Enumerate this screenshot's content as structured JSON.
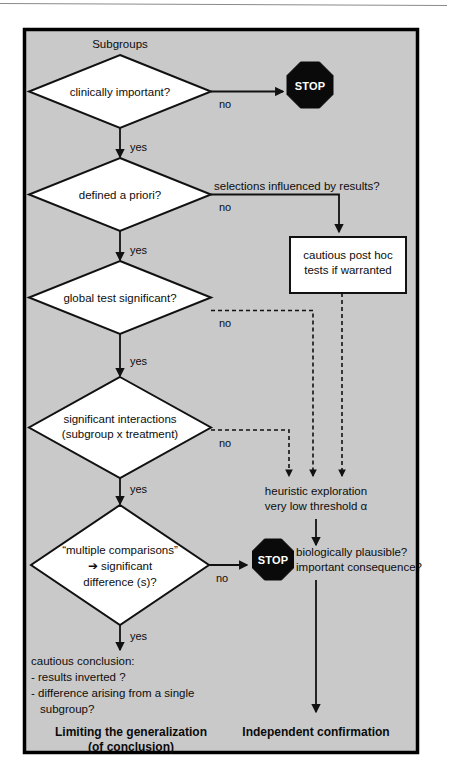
{
  "figure": {
    "title_text": "Subgroups",
    "panel_fill": "#c9c9c9",
    "border_color": "#000000"
  },
  "nodes": {
    "start_label": "Subgroups",
    "decisions": [
      {
        "id": "clinically-important",
        "lines": [
          "clinically important?"
        ]
      },
      {
        "id": "defined-a-priori",
        "lines": [
          "defined a priori?"
        ]
      },
      {
        "id": "global-test-significant",
        "lines": [
          "global test significant?"
        ]
      },
      {
        "id": "significant-interactions",
        "lines": [
          "significant interactions",
          "(subgroup x treatment)"
        ]
      },
      {
        "id": "multiple-comparisons",
        "lines": [
          "“multiple comparisons”",
          "➔ significant",
          "difference (s)?"
        ]
      }
    ],
    "process_box": {
      "id": "cautious-post-hoc",
      "lines": [
        "cautious post hoc",
        "tests if warranted"
      ]
    },
    "stops": [
      {
        "id": "stop-top",
        "label": "STOP"
      },
      {
        "id": "stop-bottom",
        "label": "STOP"
      }
    ]
  },
  "edge_labels": {
    "no_1": "no",
    "yes_1": "yes",
    "no_2": "no",
    "yes_2": "yes",
    "no_3": "no",
    "yes_3": "yes",
    "no_4": "no",
    "yes_4": "yes",
    "no_5": "no",
    "yes_5": "yes",
    "selections_influenced": "selections influenced by results?"
  },
  "annotations": {
    "heuristic_line1": "heuristic exploration",
    "heuristic_line2": "very low threshold α",
    "biologically_line1": "biologically plausible?",
    "biologically_line2": "important consequence?",
    "cautious_conclusion_line1": "cautious conclusion:",
    "cautious_conclusion_line2": "- results inverted ?",
    "cautious_conclusion_line3": "- difference arising from a single",
    "cautious_conclusion_line4": "subgroup?"
  },
  "footers": {
    "left_line1": "Limiting the generalization",
    "left_line2": "(of conclusion)",
    "right_line1": "Independent confirmation"
  }
}
